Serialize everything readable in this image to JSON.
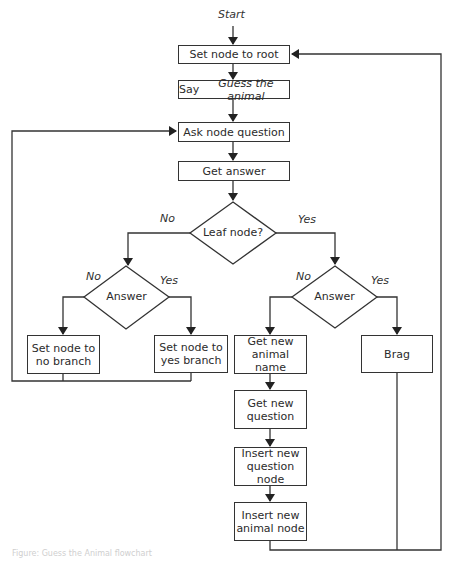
{
  "flowchart": {
    "start_label": "Start",
    "nodes": {
      "set_root": "Set node to root",
      "say_guess_prefix": "Say ",
      "say_guess_italic": "Guess the animal",
      "ask_question": "Ask node question",
      "get_answer": "Get answer",
      "leaf_node": "Leaf node?",
      "answer_left": "Answer",
      "answer_right": "Answer",
      "set_no_branch": "Set node to no branch",
      "set_yes_branch": "Set node to yes branch",
      "get_new_animal": "Get new animal name",
      "brag": "Brag",
      "get_new_question": "Get new question",
      "insert_question_node": "Insert new question node",
      "insert_animal_node": "Insert new animal node"
    },
    "edge_labels": {
      "leaf_no": "No",
      "leaf_yes": "Yes",
      "left_no": "No",
      "left_yes": "Yes",
      "right_no": "No",
      "right_yes": "Yes"
    }
  },
  "caption": "Figure: Guess the Animal flowchart",
  "colors": {
    "line": "#333333",
    "background": "#ffffff"
  }
}
